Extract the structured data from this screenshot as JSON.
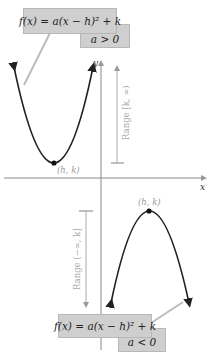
{
  "diagram": {
    "top_equation": "f(x) = a(x − h)² + k",
    "top_condition": "a > 0",
    "bottom_equation": "f(x) = a(x − h)² + k",
    "bottom_condition": "a < 0",
    "x_axis_label": "x",
    "y_axis_label": "y",
    "top_vertex_label": "(h, k)",
    "bottom_vertex_label": "(h, k)",
    "top_range_label": "Range [k, ∞)",
    "bottom_range_label": "Range (−∞, k]",
    "colors": {
      "curve": "#222222",
      "axis": "#888888",
      "range_bar": "#aaaaaa",
      "label_gray": "#999999",
      "box_fill": "#cfcfcf"
    }
  }
}
